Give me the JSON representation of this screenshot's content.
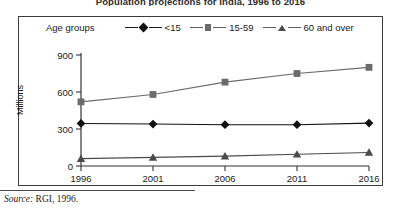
{
  "title": "Population projections for India, 1996 to 2016",
  "source": {
    "label": "Source:",
    "text": "RGI, 1996."
  },
  "legend": {
    "title": "Age groups",
    "position": "top",
    "items": [
      {
        "label": "<15",
        "marker": "diamond-marker-icon",
        "color": "#111111"
      },
      {
        "label": "15-59",
        "marker": "square-marker-icon",
        "color": "#6b6b6b"
      },
      {
        "label": "60 and over",
        "marker": "triangle-marker-icon",
        "color": "#4a4a4a"
      }
    ]
  },
  "axes": {
    "ylabel": "Millions",
    "yticks": [
      "900",
      "600",
      "300",
      "0"
    ],
    "xticks": [
      "1996",
      "2001",
      "2006",
      "2011",
      "2016"
    ]
  },
  "chart_data": {
    "type": "line",
    "title": "Population projections for India, 1996 to 2016",
    "xlabel": "",
    "ylabel": "Millions",
    "x": [
      1996,
      2001,
      2006,
      2011,
      2016
    ],
    "categories": [
      "1996",
      "2001",
      "2006",
      "2011",
      "2016"
    ],
    "ylim": [
      0,
      900
    ],
    "yticks": [
      0,
      300,
      600,
      900
    ],
    "grid": false,
    "legend_position": "top",
    "series": [
      {
        "name": "<15",
        "marker": "diamond",
        "color": "#111111",
        "values": [
          345,
          340,
          335,
          335,
          348
        ]
      },
      {
        "name": "15-59",
        "marker": "square",
        "color": "#6b6b6b",
        "values": [
          520,
          580,
          680,
          750,
          800
        ]
      },
      {
        "name": "60 and over",
        "marker": "triangle",
        "color": "#4a4a4a",
        "values": [
          60,
          70,
          80,
          95,
          110
        ]
      }
    ]
  }
}
